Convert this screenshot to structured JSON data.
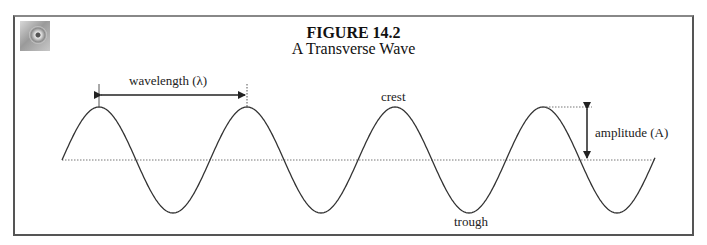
{
  "figure": {
    "number": "FIGURE 14.2",
    "title": "A Transverse Wave",
    "icon": "cd-disk-icon"
  },
  "labels": {
    "wavelength": "wavelength (λ)",
    "crest": "crest",
    "trough": "trough",
    "amplitude": "amplitude (A)"
  },
  "wave": {
    "type": "sine",
    "cycles": 4,
    "period_px": 148,
    "amplitude_px": 53,
    "baseline_y": 160,
    "start_x": 62,
    "end_x": 655,
    "crest_x": [
      99,
      247,
      395,
      543
    ],
    "trough_x": [
      173,
      321,
      469,
      617
    ]
  },
  "colors": {
    "wave": "#333333",
    "baseline": "#777777",
    "arrow": "#222222",
    "frame": "#555555"
  }
}
